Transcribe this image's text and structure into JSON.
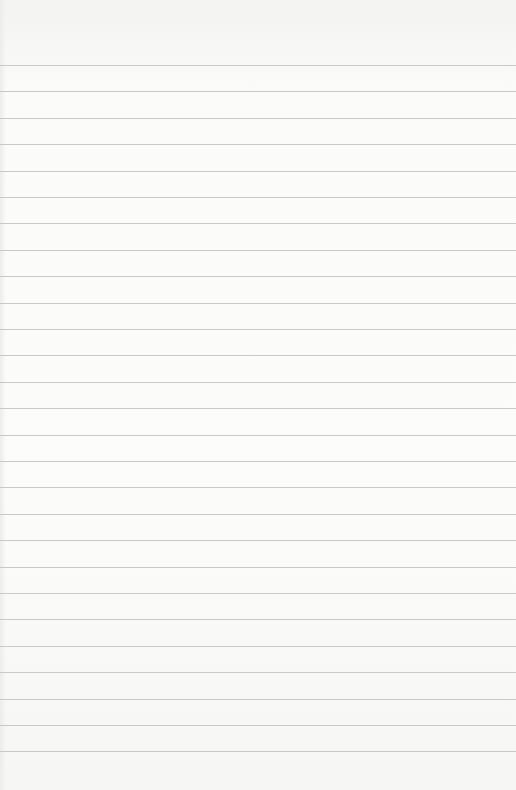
{
  "paper": {
    "type": "ruled-notebook-paper",
    "background_color": "#fbfbfa",
    "rule_color": "#c9c9c9",
    "first_rule_y": 65,
    "rule_spacing": 26.4,
    "rule_count": 27
  }
}
